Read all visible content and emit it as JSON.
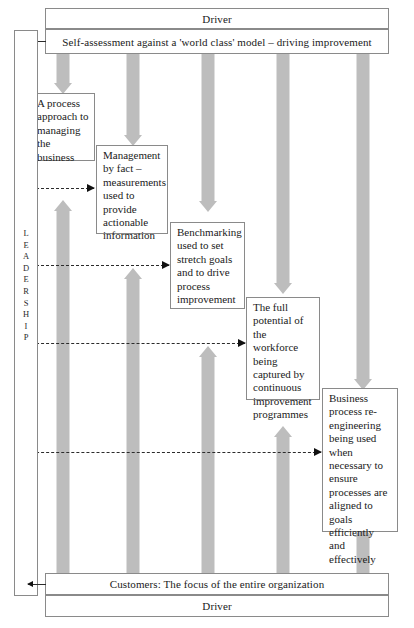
{
  "diagram": {
    "colors": {
      "arrow_fill": "#bdbdbd",
      "box_border": "#8a8a8a",
      "text": "#1a1a1a",
      "background": "#ffffff"
    }
  },
  "top": {
    "driver_label": "Driver",
    "self_assessment_label": "Self-assessment against a 'world class' model – driving improvement"
  },
  "bottom": {
    "customers_label": "Customers: The focus of the entire organization",
    "driver_label": "Driver"
  },
  "leadership": {
    "letters": [
      "L",
      "E",
      "A",
      "D",
      "E",
      "R",
      "S",
      "H",
      "I",
      "P"
    ]
  },
  "steps": [
    {
      "id": "process-approach",
      "text": "A process approach to managing the business"
    },
    {
      "id": "management-by-fact",
      "text": "Management by fact – measurements used to provide actionable information"
    },
    {
      "id": "benchmarking",
      "text": "Benchmarking used to set stretch goals and to drive process improvement"
    },
    {
      "id": "workforce-potential",
      "text": "The full potential of the workforce being captured by continuous improvement programmes"
    },
    {
      "id": "business-process-reengineering",
      "text": "Business process re-engineering being used when necessary to ensure processes are aligned to goals efficiently and effectively"
    }
  ]
}
